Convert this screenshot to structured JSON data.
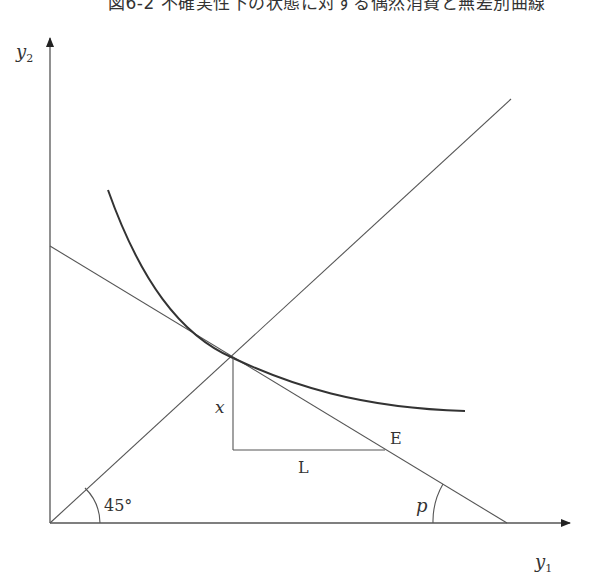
{
  "figure": {
    "title": "図6-2 不確実性下の状態に対する偶然消費と無差別曲線",
    "axes": {
      "x_label": "y",
      "x_sub": "1",
      "y_label": "y",
      "y_sub": "2"
    },
    "labels": {
      "angle_45": "45°",
      "price": "p",
      "point_E": "E",
      "segment_x": "x",
      "segment_L": "L"
    },
    "colors": {
      "line": "#555555",
      "curve": "#333333",
      "text": "#333333"
    }
  }
}
